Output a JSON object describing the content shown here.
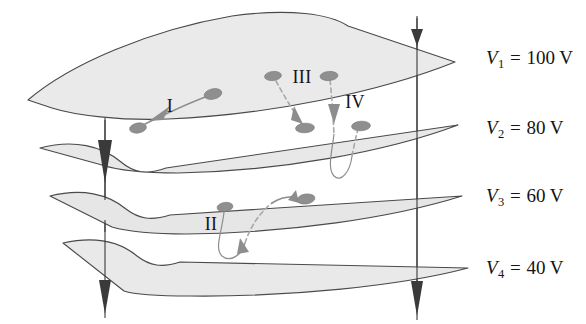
{
  "figure": {
    "type": "physics-diagram",
    "background_color": "#ffffff",
    "surface_fill_color": "#eaeaea",
    "surface_edge_color": "#4a4a4a",
    "charge_color": "#8f8f8f",
    "field_line_color": "#3a3a3a"
  },
  "voltage_labels": [
    {
      "symbol": "V",
      "subscript": "1",
      "equals": "=",
      "value": "100 V",
      "full_text": "V1 = 100 V"
    },
    {
      "symbol": "V",
      "subscript": "2",
      "equals": "=",
      "value": "80 V",
      "full_text": "V2 = 80 V"
    },
    {
      "symbol": "V",
      "subscript": "3",
      "equals": "=",
      "value": "60 V",
      "full_text": "V3 = 60 V"
    },
    {
      "symbol": "V",
      "subscript": "4",
      "equals": "=",
      "value": "40 V",
      "full_text": "V4 = 40 V"
    }
  ],
  "path_labels": [
    {
      "id": "I",
      "text": "I"
    },
    {
      "id": "II",
      "text": "II"
    },
    {
      "id": "III",
      "text": "III"
    },
    {
      "id": "IV",
      "text": "IV"
    }
  ],
  "surfaces": [
    {
      "name": "equipotential-surface-1",
      "voltage": "100 V"
    },
    {
      "name": "equipotential-surface-2",
      "voltage": "80 V"
    },
    {
      "name": "equipotential-surface-3",
      "voltage": "60 V"
    },
    {
      "name": "equipotential-surface-4",
      "voltage": "40 V"
    }
  ],
  "field_lines": [
    {
      "name": "field-line-left",
      "direction": "downward"
    },
    {
      "name": "field-line-right",
      "direction": "downward"
    }
  ],
  "charges": [
    {
      "name": "charge-path-I-start",
      "on_surface": "V1"
    },
    {
      "name": "charge-path-I-end",
      "on_surface": "V1"
    },
    {
      "name": "charge-path-II-start",
      "on_surface": "V3"
    },
    {
      "name": "charge-path-II-end",
      "on_surface": "V3"
    },
    {
      "name": "charge-path-III-start",
      "on_surface": "V1"
    },
    {
      "name": "charge-path-III-end",
      "on_surface": "V2"
    },
    {
      "name": "charge-path-IV-start",
      "on_surface": "V1"
    },
    {
      "name": "charge-path-IV-end",
      "on_surface": "V2"
    }
  ]
}
